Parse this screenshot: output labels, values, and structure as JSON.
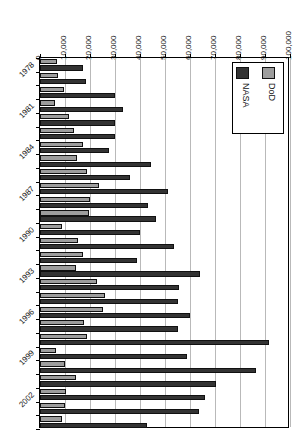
{
  "chart_data": {
    "type": "bar",
    "orientation": "horizontal",
    "title": "",
    "xlabel": "",
    "ylabel": "",
    "xlim": [
      0,
      100000
    ],
    "xticks": [
      0,
      10000,
      20000,
      30000,
      40000,
      50000,
      60000,
      70000,
      80000,
      90000,
      100000
    ],
    "xtick_labels": [
      "0",
      "10,000",
      "20,000",
      "30,000",
      "40,000",
      "50,000",
      "60,000",
      "70,000",
      "80,000",
      "90,000",
      "100,000"
    ],
    "grid": true,
    "legend_position": "top-right",
    "categories": [
      "1978",
      "1979",
      "1980",
      "1981",
      "1982",
      "1983",
      "1984",
      "1985",
      "1986",
      "1987",
      "1988",
      "1989",
      "1990",
      "1991",
      "1992",
      "1993",
      "1994",
      "1995",
      "1996",
      "1997",
      "1998",
      "1999",
      "2000",
      "2001",
      "2002",
      "2003",
      "2004"
    ],
    "category_tick_labels": [
      "1978",
      "",
      "",
      "1981",
      "",
      "",
      "1984",
      "",
      "",
      "1987",
      "",
      "",
      "1990",
      "",
      "",
      "1993",
      "",
      "",
      "1996",
      "",
      "",
      "1999",
      "",
      "",
      "2002",
      "",
      ""
    ],
    "series": [
      {
        "name": "DoD",
        "color": "#9d9d9d",
        "values": [
          6800,
          7200,
          9600,
          5800,
          11400,
          13400,
          17200,
          14600,
          18600,
          23600,
          20000,
          19400,
          8800,
          15200,
          17000,
          14400,
          22600,
          25800,
          25000,
          17400,
          18600,
          6400,
          10000,
          14400,
          10400,
          10000,
          8800
        ]
      },
      {
        "name": "NASA",
        "color": "#333333",
        "values": [
          17000,
          18400,
          30000,
          33200,
          29800,
          30000,
          27400,
          44200,
          35800,
          51200,
          43000,
          46200,
          39800,
          53400,
          38600,
          64000,
          55600,
          55200,
          60000,
          55200,
          91400,
          58600,
          86400,
          70400,
          65800,
          63600,
          42800
        ]
      }
    ]
  },
  "legend": {
    "entries": [
      {
        "label": "NASA",
        "color": "#333333"
      },
      {
        "label": "DoD",
        "color": "#9d9d9d"
      }
    ]
  }
}
